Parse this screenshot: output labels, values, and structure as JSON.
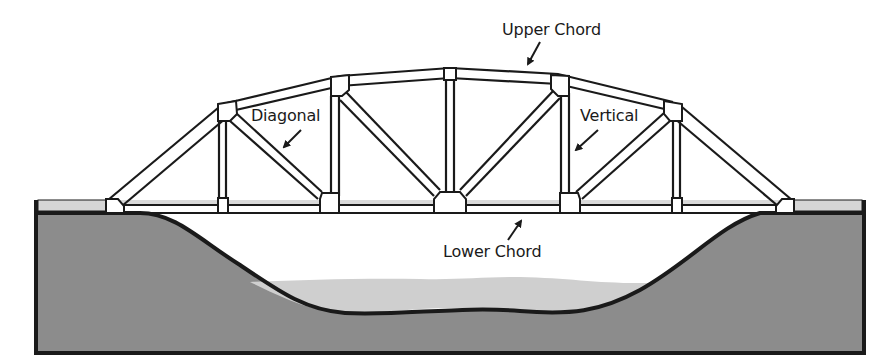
{
  "diagram": {
    "labels": {
      "upper_chord": "Upper Chord",
      "diagonal": "Diagonal",
      "vertical": "Vertical",
      "lower_chord": "Lower Chord"
    },
    "colors": {
      "line": "#1a1a1a",
      "ground": "#8c8c8c",
      "water": "#cfcfcf",
      "deck": "#d6d6d6",
      "background": "#ffffff"
    }
  }
}
